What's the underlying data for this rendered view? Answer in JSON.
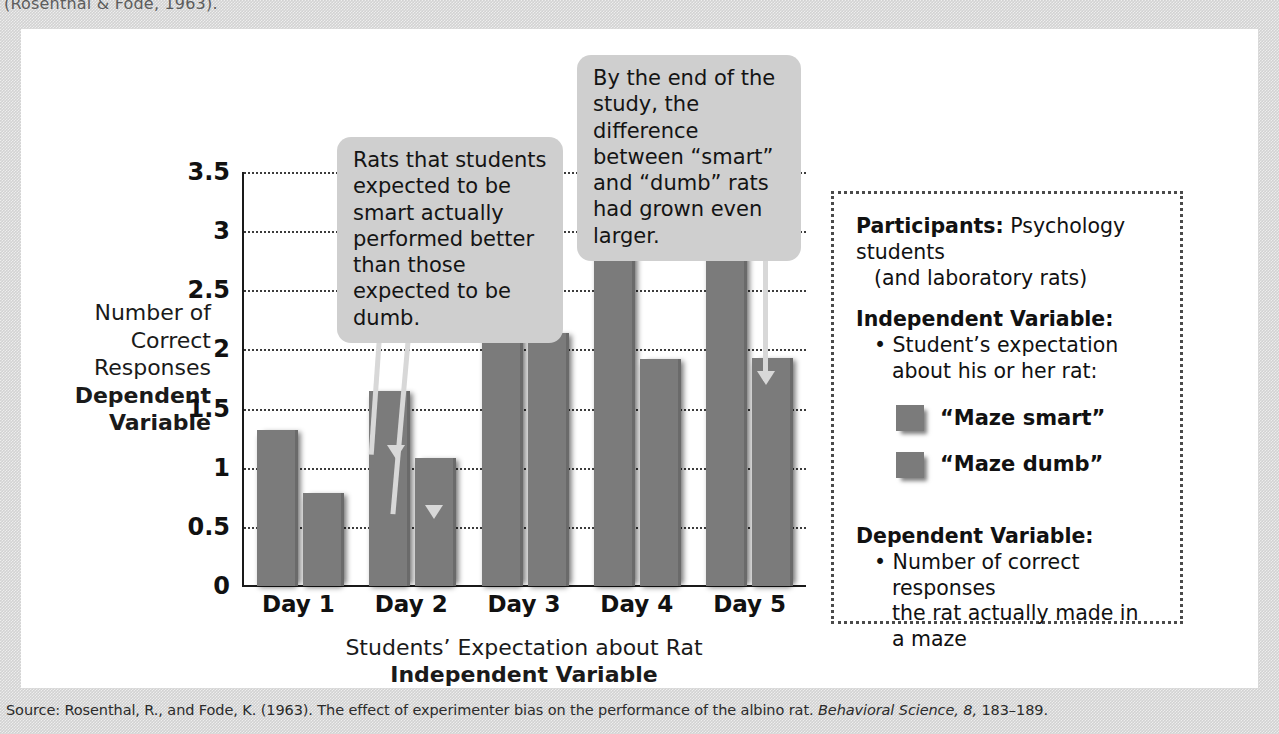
{
  "top_caption": "(Rosenthal & Fode, 1963).",
  "source": {
    "prefix": "Source: Rosenthal, R., and Fode, K. (1963). The effect of experimenter bias on the performance of the albino rat. ",
    "journal": "Behavioral Science, 8,",
    "pages": " 183–189."
  },
  "chart_data": {
    "type": "bar",
    "title": "",
    "categories": [
      "Day 1",
      "Day 2",
      "Day 3",
      "Day 4",
      "Day 5"
    ],
    "series": [
      {
        "name": "“Maze smart”",
        "values": [
          1.32,
          1.65,
          2.6,
          2.89,
          3.28
        ],
        "color": "#7b7b7b"
      },
      {
        "name": "“Maze dumb”",
        "values": [
          0.79,
          1.08,
          2.14,
          1.92,
          1.93
        ],
        "color": "#7b7b7b"
      }
    ],
    "ylim": [
      0,
      3.5
    ],
    "yticks": [
      "0",
      "0.5",
      "1",
      "1.5",
      "2",
      "2.5",
      "3",
      "3.5"
    ],
    "ytick_values": [
      0,
      0.5,
      1,
      1.5,
      2,
      2.5,
      3,
      3.5
    ],
    "ylabel_plain": "Number of\nCorrect\nResponses",
    "ylabel_bold": "Dependent\nVariable",
    "xlabel_plain": "Students’ Expectation about Rat",
    "xlabel_bold": "Independent Variable",
    "grid": true,
    "legend_position": "right-box"
  },
  "y_axis_title": {
    "line1": "Number of",
    "line2": "Correct",
    "line3": "Responses",
    "bold1": "Dependent",
    "bold2": "Variable"
  },
  "x_axis_title": {
    "plain": "Students’ Expectation about Rat",
    "bold": "Independent Variable"
  },
  "callouts": [
    {
      "id": "callout-1",
      "text": "Rats that students expected to be smart actually performed better than those expected to be dumb."
    },
    {
      "id": "callout-2",
      "text": "By the end of the study, the difference between “smart” and “dumb” rats had grown even larger."
    }
  ],
  "infobox": {
    "participants_label": "Participants:",
    "participants_value": " Psychology students",
    "participants_value2": "(and laboratory rats)",
    "independent_header": "Independent Variable:",
    "independent_bullet_l1": "• Student’s expectation",
    "independent_bullet_l2": "about his or her rat:",
    "legend": [
      {
        "label": "“Maze smart”",
        "color": "#7b7b7b"
      },
      {
        "label": "“Maze dumb”",
        "color": "#7b7b7b"
      }
    ],
    "dependent_header": "Dependent Variable:",
    "dependent_bullet_l1": "• Number of correct responses",
    "dependent_bullet_l2": "the rat actually made in",
    "dependent_bullet_l3": "a maze"
  }
}
